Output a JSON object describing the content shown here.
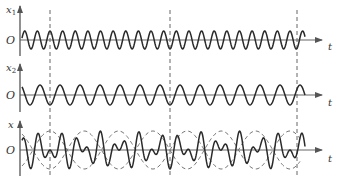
{
  "figure": {
    "colors": {
      "wave": "#2a2a2a",
      "axis": "#555555",
      "dashed": "#666666",
      "envelope": "#777777"
    },
    "origin_label": "O",
    "time_label": "t",
    "rows": [
      {
        "id": "x1",
        "ylabel": "x",
        "ysub": "1",
        "axis_y": 40,
        "amplitude": 9,
        "period_px": 12.63,
        "phase": "peak at dashed lines"
      },
      {
        "id": "x2",
        "ylabel": "x",
        "ysub": "2",
        "axis_y": 95,
        "amplitude": 10,
        "period_px": 20.0,
        "phase": "trough at dashed lines"
      },
      {
        "id": "x",
        "ylabel": "x",
        "ysub": "",
        "axis_y": 150,
        "amplitude": 19,
        "note": "x = x1 + x2, beat envelope dashed"
      }
    ],
    "dashed_lines_x": [
      50,
      170,
      297
    ],
    "wave_x_range": [
      22,
      305
    ]
  }
}
